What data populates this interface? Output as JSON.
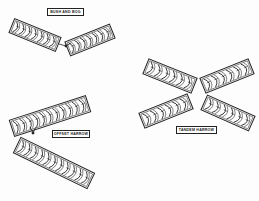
{
  "diagram": {
    "type": "disk-harrow-configurations",
    "colors": {
      "ink": "#222222",
      "background": "#fdfdfd"
    },
    "groups": [
      {
        "id": "bush-and-bog",
        "label": "BUSH AND BOG",
        "label_box": {
          "x": 47,
          "y": 8,
          "w": 37,
          "h": 8
        },
        "gangs": [
          {
            "cx": 35,
            "cy": 35,
            "length": 50,
            "width": 15,
            "angle": 22,
            "disks": 7
          },
          {
            "cx": 90,
            "cy": 40,
            "length": 48,
            "width": 15,
            "angle": -22,
            "disks": 7
          }
        ],
        "hitch": {
          "x": 66,
          "y": 46
        }
      },
      {
        "id": "offset-harrow",
        "label": "OFFSET HARROW",
        "label_box": {
          "x": 52,
          "y": 130,
          "w": 38,
          "h": 8
        },
        "gangs": [
          {
            "cx": 50,
            "cy": 116,
            "length": 80,
            "width": 17,
            "angle": -18,
            "disks": 11
          },
          {
            "cx": 54,
            "cy": 163,
            "length": 82,
            "width": 17,
            "angle": 26,
            "disks": 11
          }
        ],
        "hitch": {
          "x": 33,
          "y": 133
        }
      },
      {
        "id": "tandem-harrow",
        "label": "TANDEM HARROW",
        "label_box": {
          "x": 176,
          "y": 126,
          "w": 41,
          "h": 8
        },
        "gangs": [
          {
            "cx": 170,
            "cy": 76,
            "length": 52,
            "width": 16,
            "angle": 22,
            "disks": 6
          },
          {
            "cx": 227,
            "cy": 76,
            "length": 52,
            "width": 16,
            "angle": -22,
            "disks": 6
          },
          {
            "cx": 166,
            "cy": 111,
            "length": 52,
            "width": 16,
            "angle": -22,
            "disks": 6
          },
          {
            "cx": 228,
            "cy": 113,
            "length": 52,
            "width": 16,
            "angle": 24,
            "disks": 6
          }
        ]
      }
    ]
  }
}
